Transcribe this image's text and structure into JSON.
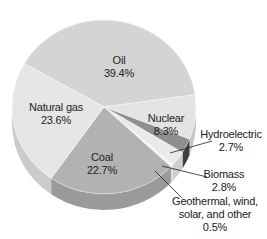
{
  "chart_data": {
    "type": "pie",
    "title": "",
    "style": "3d",
    "categories": [
      "Oil",
      "Nuclear",
      "Hydroelectric",
      "Biomass",
      "Geothermal, wind, solar, and other",
      "Coal",
      "Natural gas"
    ],
    "values": [
      39.4,
      8.3,
      2.7,
      2.8,
      0.5,
      22.7,
      23.6
    ],
    "unit": "%",
    "colors": [
      "#d4d4d4",
      "#e3e3e3",
      "#8f8f8f",
      "#e9e9e9",
      "#f4f4f4",
      "#b2b2b2",
      "#e6e6e6"
    ],
    "side_colors": [
      "#bdbdbd",
      "#c8c8c8",
      "#3e3e3e",
      "#cfcfcf",
      "#dcdcdc",
      "#9a9a9a",
      "#cbcbcb"
    ]
  },
  "labels": {
    "oil": {
      "name": "Oil",
      "pct": "39.4%"
    },
    "natural_gas": {
      "name": "Natural gas",
      "pct": "23.6%"
    },
    "nuclear": {
      "name": "Nuclear",
      "pct": "8.3%"
    },
    "coal": {
      "name": "Coal",
      "pct": "22.7%"
    },
    "hydro": {
      "name": "Hydroelectric",
      "pct": "2.7%"
    },
    "biomass": {
      "name": "Biomass",
      "pct": "2.8%"
    },
    "other": {
      "name1": "Geothermal, wind,",
      "name2": "solar, and other",
      "pct": "0.5%"
    }
  }
}
